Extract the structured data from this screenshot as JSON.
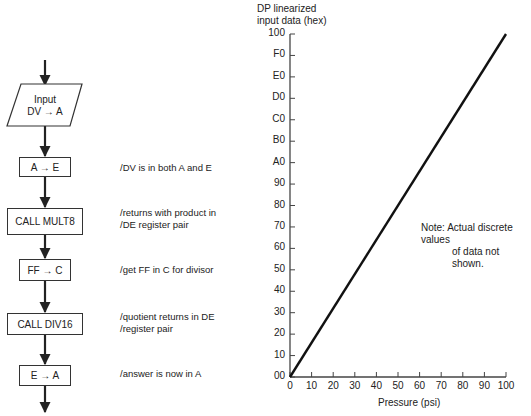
{
  "flowchart": {
    "input_step": {
      "line1": "Input",
      "line2": "DV → A"
    },
    "steps": [
      {
        "label": "A → E",
        "comment_lines": [
          "/DV is in both A and E"
        ]
      },
      {
        "label": "CALL MULT8",
        "comment_lines": [
          "/returns with product in",
          "/DE register pair"
        ]
      },
      {
        "label": "FF → C",
        "comment_lines": [
          "/get FF in C for divisor"
        ]
      },
      {
        "label": "CALL DIV16",
        "comment_lines": [
          "/quotient returns in DE",
          "/register pair"
        ]
      },
      {
        "label": "E → A",
        "comment_lines": [
          "/answer is now in A"
        ]
      }
    ]
  },
  "chart_data": {
    "type": "line",
    "title": "",
    "ylabel": "DP linearized input data (hex)",
    "xlabel": "Pressure (psi)",
    "x_ticks": [
      "0",
      "10",
      "20",
      "30",
      "40",
      "50",
      "60",
      "70",
      "80",
      "90",
      "100"
    ],
    "y_ticks": [
      "00",
      "10",
      "20",
      "30",
      "40",
      "50",
      "60",
      "70",
      "80",
      "90",
      "A0",
      "B0",
      "C0",
      "D0",
      "E0",
      "F0",
      "100"
    ],
    "xlim": [
      0,
      100
    ],
    "ylim_hex": [
      "00",
      "100"
    ],
    "series": [
      {
        "name": "linearized data",
        "x": [
          0,
          100
        ],
        "y_hex": [
          "00",
          "100"
        ],
        "y_decimal": [
          0,
          256
        ]
      }
    ],
    "annotation": {
      "line1": "Note:  Actual discrete values",
      "line2": "of data not shown."
    },
    "grid": false,
    "legend": "none"
  }
}
